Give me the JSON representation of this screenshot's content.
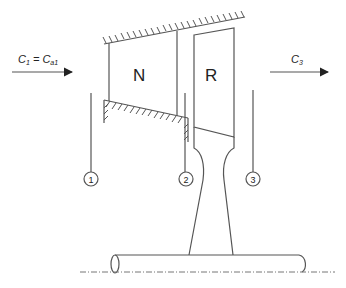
{
  "diagram": {
    "labels": {
      "nozzle": "N",
      "rotor": "R",
      "inlet_velocity_main": "C",
      "inlet_velocity_sub": "1",
      "inlet_equals": " = C",
      "inlet_axial_sub": "a1",
      "exit_velocity_main": "C",
      "exit_velocity_sub": "3"
    },
    "stations": [
      {
        "id": "1",
        "label": "1"
      },
      {
        "id": "2",
        "label": "2"
      },
      {
        "id": "3",
        "label": "3"
      }
    ],
    "colors": {
      "stroke": "#555555",
      "text": "#222222",
      "background": "#ffffff"
    }
  }
}
